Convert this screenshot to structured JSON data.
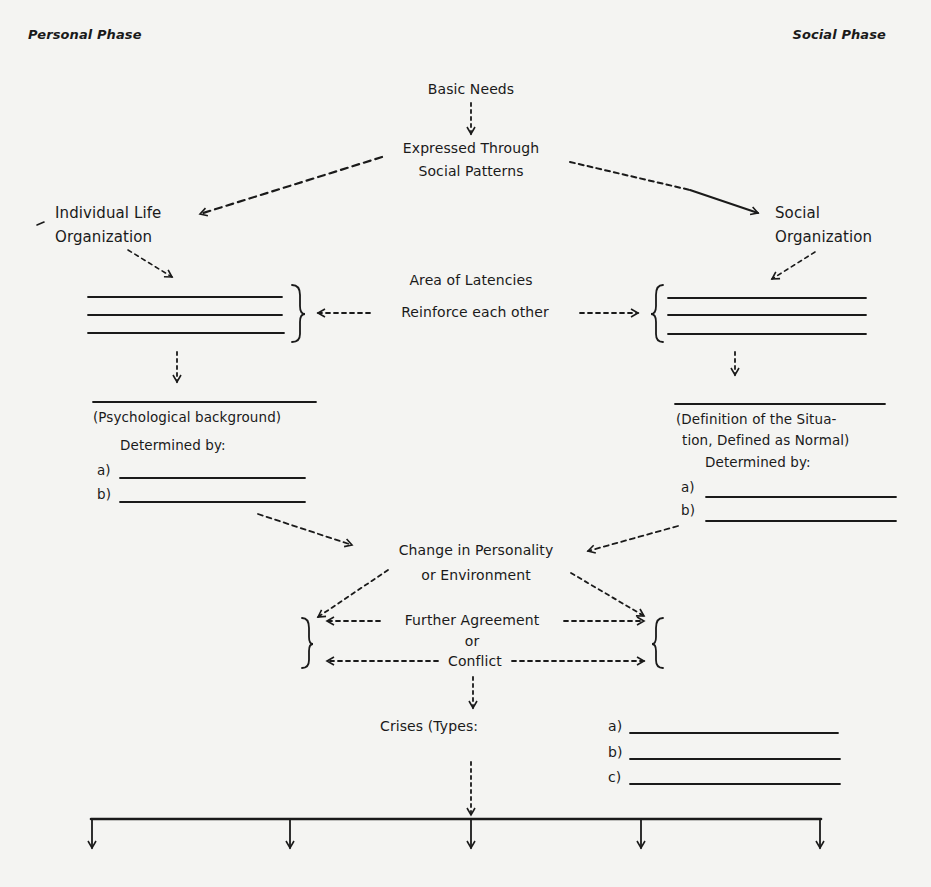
{
  "header": {
    "left_phase": "Personal Phase",
    "right_phase": "Social Phase"
  },
  "top": {
    "basic_needs": "Basic Needs",
    "expressed_line1": "Expressed Through",
    "expressed_line2": "Social Patterns"
  },
  "left": {
    "org_line1": "Individual Life",
    "org_line2": "Organization",
    "background_label": "(Psychological background)",
    "determined_by": "Determined by:",
    "items": [
      "a)",
      "b)"
    ]
  },
  "right": {
    "org_line1": "Social",
    "org_line2": "Organization",
    "definition_line1": "(Definition of the Situa-",
    "definition_line2": "tion, Defined as Normal)",
    "determined_by": "Determined by:",
    "items": [
      "a)",
      "b)"
    ]
  },
  "center": {
    "area_of_latencies": "Area of Latencies",
    "reinforce": "Reinforce each other",
    "change_line1": "Change in Personality",
    "change_line2": "or Environment",
    "further_agreement": "Further Agreement",
    "or": "or",
    "conflict": "Conflict"
  },
  "crises": {
    "label": "Crises (Types:",
    "types": [
      "a)",
      "b)",
      "c)"
    ]
  },
  "bottom": {
    "branch_count": 5
  },
  "colors": {
    "background": "#f4f4f2",
    "ink": "#1a1a1a"
  }
}
